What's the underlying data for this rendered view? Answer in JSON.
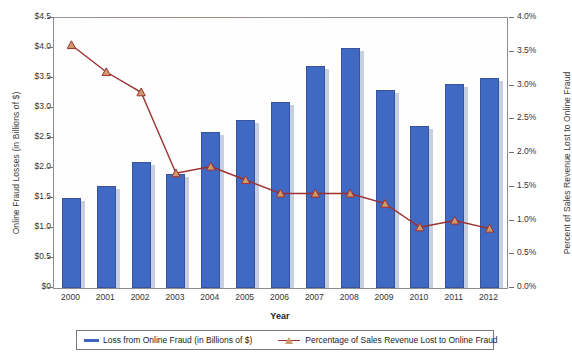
{
  "chart_data": {
    "type": "bar",
    "title": "",
    "xlabel": "Year",
    "categories": [
      "2000",
      "2001",
      "2002",
      "2003",
      "2004",
      "2005",
      "2006",
      "2007",
      "2008",
      "2009",
      "2010",
      "2011",
      "2012"
    ],
    "grid": false,
    "legend_position": "bottom",
    "series": [
      {
        "name": "Loss from Online Fraud (in Billions of $)",
        "type": "bar",
        "axis": "left",
        "color": "#4069c4",
        "values": [
          1.5,
          1.7,
          2.1,
          1.9,
          2.6,
          2.8,
          3.1,
          3.7,
          4.0,
          3.3,
          2.7,
          3.4,
          3.5
        ]
      },
      {
        "name": "Percentage of Sales Revenue Lost to Online Fraud",
        "type": "line",
        "axis": "right",
        "color": "#9e2f2f",
        "marker_color": "#cd9a6a",
        "values": [
          3.6,
          3.2,
          2.9,
          1.7,
          1.8,
          1.6,
          1.4,
          1.4,
          1.4,
          1.25,
          0.9,
          1.0,
          0.88
        ]
      }
    ],
    "left_axis": {
      "label": "Online Fraud Losses (in Billions of $)",
      "ylim": [
        0,
        4.5
      ],
      "ticks": [
        0,
        0.5,
        1.0,
        1.5,
        2.0,
        2.5,
        3.0,
        3.5,
        4.0,
        4.5
      ],
      "tick_labels": [
        "$0",
        "$0.5",
        "$1.0",
        "$1.5",
        "$2.0",
        "$2.5",
        "$3.0",
        "$3.5",
        "$4.0",
        "$4.5"
      ],
      "color": "#333333"
    },
    "right_axis": {
      "label": "Percent of Sales Revenue Lost to Online Fraud",
      "ylim": [
        0,
        4.0
      ],
      "ticks": [
        0,
        0.5,
        1.0,
        1.5,
        2.0,
        2.5,
        3.0,
        3.5,
        4.0
      ],
      "tick_labels": [
        "0.0%",
        "0.5%",
        "1.0%",
        "1.5%",
        "2.0%",
        "2.5%",
        "3.0%",
        "3.5%",
        "4.0%"
      ],
      "color": "#333333"
    }
  },
  "legend": {
    "bar_label": "Loss from Online Fraud (in Billions of $)",
    "line_label": "Percentage of Sales Revenue Lost to Online Fraud"
  }
}
